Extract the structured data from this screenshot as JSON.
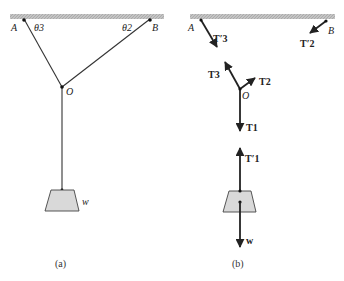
{
  "figure": {
    "panel_a": {
      "caption": "(a)",
      "points": {
        "A": "A",
        "B": "B",
        "O": "O"
      },
      "angles": {
        "theta3": "θ3",
        "theta2": "θ2"
      },
      "weight_label": "w"
    },
    "panel_b": {
      "caption": "(b)",
      "points": {
        "A": "A",
        "B": "B",
        "O": "O"
      },
      "forces": {
        "T3_prime": "T′3",
        "T2_prime": "T′2",
        "T3": "T3",
        "T2": "T2",
        "T1": "T1",
        "T1_prime": "T′1",
        "w": "w"
      }
    },
    "colors": {
      "ceiling": "#b8b8b8",
      "line": "#333333",
      "weight_fill": "#d9d9d9",
      "weight_stroke": "#444444"
    }
  }
}
